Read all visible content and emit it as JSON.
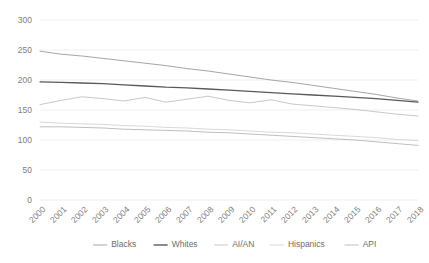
{
  "chart_data": {
    "type": "line",
    "title": "",
    "xlabel": "",
    "ylabel": "",
    "ylim": [
      0,
      300
    ],
    "y_ticks": [
      0,
      50,
      100,
      150,
      200,
      250,
      300
    ],
    "grid": true,
    "legend_position": "bottom",
    "x": [
      "2000",
      "2001",
      "2002",
      "2003",
      "2004",
      "2005",
      "2006",
      "2007",
      "2008",
      "2009",
      "2010",
      "2011",
      "2012",
      "2013",
      "2014",
      "2015",
      "2016",
      "2017",
      "2018"
    ],
    "series": [
      {
        "name": "Blacks",
        "color": "#a6a6a6",
        "values": [
          248,
          243,
          240,
          236,
          232,
          228,
          224,
          219,
          215,
          210,
          205,
          200,
          196,
          191,
          186,
          181,
          176,
          170,
          165
        ]
      },
      {
        "name": "Whites",
        "color": "#595959",
        "values": [
          197,
          196,
          195,
          194,
          192,
          190,
          188,
          187,
          185,
          183,
          181,
          179,
          177,
          175,
          173,
          171,
          169,
          166,
          163
        ]
      },
      {
        "name": "AI/AN",
        "color": "#c9c9c9",
        "values": [
          159,
          166,
          172,
          169,
          165,
          171,
          163,
          168,
          173,
          166,
          162,
          167,
          160,
          157,
          154,
          151,
          147,
          143,
          140
        ]
      },
      {
        "name": "Hispanics",
        "color": "#d9d9d9",
        "values": [
          130,
          128,
          127,
          126,
          124,
          123,
          121,
          120,
          118,
          117,
          115,
          113,
          112,
          110,
          108,
          106,
          104,
          101,
          99
        ]
      },
      {
        "name": "API",
        "color": "#bfbfbf",
        "values": [
          122,
          122,
          121,
          120,
          118,
          117,
          116,
          115,
          113,
          112,
          110,
          108,
          106,
          104,
          102,
          100,
          97,
          94,
          91
        ]
      }
    ]
  },
  "legend": {
    "items": [
      {
        "label": "Blacks",
        "color": "#a6a6a6"
      },
      {
        "label": "Whites",
        "color": "#595959"
      },
      {
        "label": "AI/AN",
        "color": "#c9c9c9"
      },
      {
        "label": "Hispanics",
        "color": "#d9d9d9"
      },
      {
        "label": "API",
        "color": "#bfbfbf"
      }
    ]
  },
  "axis_colors": {
    "gridline": "#e8e8e8",
    "tick_text": "#808080"
  }
}
